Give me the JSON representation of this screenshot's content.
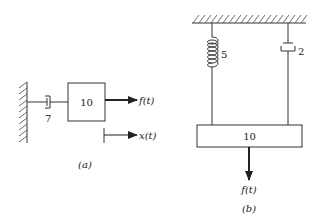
{
  "diagram_a": {
    "caption": "(a)",
    "mass_value": "10",
    "damper_value": "7",
    "force_label": "f(t)",
    "displacement_label": "x(t)"
  },
  "diagram_b": {
    "caption": "(b)",
    "mass_value": "10",
    "spring_value": "5",
    "damper_value": "2",
    "force_label": "f(t)"
  }
}
